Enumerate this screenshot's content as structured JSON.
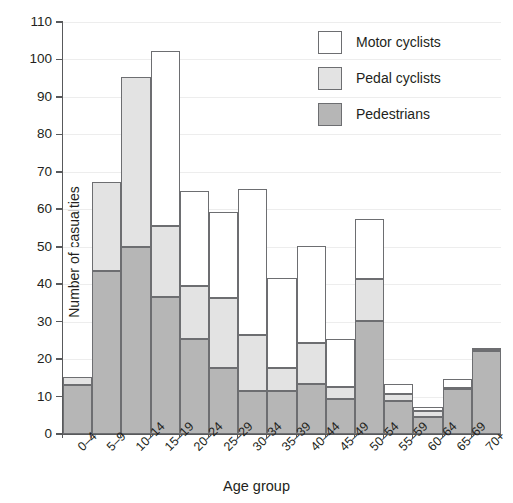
{
  "chart_data": {
    "type": "bar",
    "subtype": "stacked",
    "title": "",
    "xlabel": "Age group",
    "ylabel": "Number of casualties",
    "ylim": [
      0,
      110
    ],
    "ytick_step": 10,
    "yticks": [
      0,
      10,
      20,
      30,
      40,
      50,
      60,
      70,
      80,
      90,
      100,
      110
    ],
    "grid": true,
    "grid_axis": "y",
    "legend_position": "top-right",
    "categories": [
      "0–4",
      "5–9",
      "10–14",
      "15–19",
      "20–24",
      "25–29",
      "30–34",
      "35–39",
      "40–44",
      "45–49",
      "50–54",
      "55–59",
      "60–64",
      "65–69",
      "70+"
    ],
    "series": [
      {
        "name": "Pedestrians",
        "color": "#b6b6b6",
        "values": [
          13.2,
          43.4,
          50.0,
          36.7,
          25.3,
          17.7,
          11.4,
          11.4,
          13.3,
          9.4,
          30.3,
          8.7,
          4.5,
          11.9,
          22.2
        ]
      },
      {
        "name": "Pedal cyclists",
        "color": "#e3e3e3",
        "values": [
          2.1,
          23.9,
          45.3,
          18.8,
          14.2,
          18.5,
          15.0,
          6.3,
          11.0,
          3.2,
          11.0,
          1.9,
          1.6,
          0.3,
          0.3
        ]
      },
      {
        "name": "Motor cyclists",
        "color": "#ffffff",
        "values": [
          0.0,
          0.0,
          0.0,
          46.7,
          25.5,
          23.1,
          38.9,
          23.9,
          25.9,
          12.9,
          16.2,
          2.7,
          1.1,
          2.6,
          0.4
        ]
      }
    ],
    "totals": [
      15.3,
      67.3,
      95.3,
      102.2,
      65.0,
      59.3,
      65.3,
      41.6,
      50.2,
      25.5,
      57.5,
      13.3,
      7.2,
      14.8,
      22.9
    ],
    "cumulative": {
      "pedestrians_top": [
        13.2,
        43.4,
        50.0,
        36.7,
        25.3,
        17.7,
        11.4,
        11.4,
        13.3,
        9.4,
        30.3,
        8.7,
        4.5,
        11.9,
        22.2
      ],
      "pedal_top": [
        15.3,
        67.3,
        95.3,
        55.5,
        39.5,
        36.2,
        26.4,
        17.7,
        24.3,
        12.6,
        41.3,
        10.6,
        6.1,
        12.2,
        22.5
      ]
    }
  },
  "legend": {
    "items": [
      {
        "label": "Motor cyclists",
        "swatch": "motor"
      },
      {
        "label": "Pedal cyclists",
        "swatch": "pedal"
      },
      {
        "label": "Pedestrians",
        "swatch": "ped"
      }
    ]
  }
}
